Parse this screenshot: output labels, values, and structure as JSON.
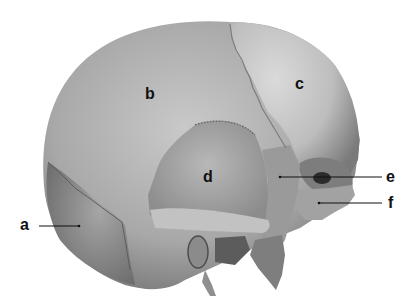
{
  "diagram": {
    "type": "anatomical-illustration",
    "colors": {
      "background": "#ffffff",
      "bone_mid": "#9e9e9e",
      "bone_light": "#cfcfcf",
      "bone_dark": "#6a6a6a",
      "label": "#111111",
      "leader_line": "#111111"
    },
    "labels": [
      {
        "id": "a",
        "text": "a",
        "leader": true
      },
      {
        "id": "b",
        "text": "b",
        "leader": false
      },
      {
        "id": "c",
        "text": "c",
        "leader": false
      },
      {
        "id": "d",
        "text": "d",
        "leader": false
      },
      {
        "id": "e",
        "text": "e",
        "leader": true
      },
      {
        "id": "f",
        "text": "f",
        "leader": true
      }
    ]
  }
}
